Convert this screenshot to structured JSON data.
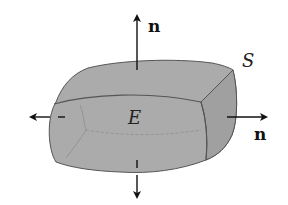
{
  "figure": {
    "labels": {
      "region": "E",
      "surface": "S",
      "normal_top": "n",
      "normal_right": "n"
    },
    "colors": {
      "solid_fill": "#a9a9a9",
      "side_fill": "#9e9e9e",
      "edge": "#555555",
      "arrow": "#111111",
      "background": "#ffffff"
    },
    "arrows": [
      {
        "name": "top-normal",
        "direction": "up"
      },
      {
        "name": "right-normal",
        "direction": "right"
      },
      {
        "name": "left-normal",
        "direction": "left"
      },
      {
        "name": "bottom-normal",
        "direction": "down"
      }
    ]
  }
}
